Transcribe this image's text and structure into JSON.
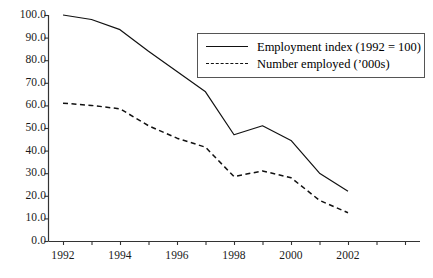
{
  "chart_data": {
    "type": "line",
    "title": "",
    "subtitle": "",
    "xlabel": "",
    "ylabel": "",
    "x": [
      1992,
      1993,
      1994,
      1995,
      1996,
      1997,
      1998,
      1999,
      2000,
      2001,
      2002
    ],
    "xlim": [
      1992,
      2002
    ],
    "ylim": [
      0.0,
      100.0
    ],
    "grid": false,
    "legend_position": "upper-right",
    "xtick_labels": [
      "1992",
      "1994",
      "1996",
      "1998",
      "2000",
      "2002"
    ],
    "xtick_values": [
      1992,
      1994,
      1996,
      1998,
      2000,
      2002
    ],
    "ytick_labels": [
      "0.0",
      "10.0",
      "20.0",
      "30.0",
      "40.0",
      "50.0",
      "60.0",
      "70.0",
      "80.0",
      "90.0",
      "100.0"
    ],
    "ytick_values": [
      0,
      10,
      20,
      30,
      40,
      50,
      60,
      70,
      80,
      90,
      100
    ],
    "series": [
      {
        "name": "Employment index (1992 = 100)",
        "style": "solid",
        "color": "#111111",
        "values": [
          100.0,
          98.0,
          93.5,
          84.0,
          75.0,
          66.0,
          47.0,
          51.0,
          44.5,
          30.0,
          22.0
        ]
      },
      {
        "name": "Number employed ('000s)",
        "style": "dashed",
        "color": "#111111",
        "values": [
          61.0,
          60.0,
          58.5,
          51.0,
          45.5,
          41.5,
          28.5,
          31.0,
          28.0,
          18.0,
          12.5
        ]
      }
    ]
  },
  "legend": {
    "entries": [
      {
        "label": "Employment index (1992 = 100)",
        "style": "solid"
      },
      {
        "label": "Number employed (’000s)",
        "style": "dashed"
      }
    ]
  },
  "axes": {
    "axis_color": "#333333",
    "plot_left_px": 48,
    "plot_right_px": 420,
    "plot_top_px": 15,
    "plot_bottom_px": 241
  }
}
